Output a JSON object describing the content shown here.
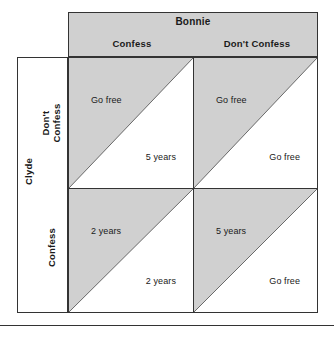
{
  "figure": {
    "column_player": {
      "name": "Bonnie",
      "strategies": [
        "Confess",
        "Don't Confess"
      ]
    },
    "row_player": {
      "name": "Clyde",
      "strategies": [
        "Don't Confess",
        "Confess"
      ]
    },
    "cells": [
      {
        "id": "clyde-dont-confess-bonnie-confess",
        "row": "Don't Confess",
        "column": "Confess",
        "upper_payoff": "Go free",
        "lower_payoff": "5 years"
      },
      {
        "id": "clyde-dont-confess-bonnie-dont-confess",
        "row": "Don't Confess",
        "column": "Don't Confess",
        "upper_payoff": "Go free",
        "lower_payoff": "Go free"
      },
      {
        "id": "clyde-confess-bonnie-confess",
        "row": "Confess",
        "column": "Confess",
        "upper_payoff": "2 years",
        "lower_payoff": "2 years"
      },
      {
        "id": "clyde-confess-bonnie-dont-confess",
        "row": "Confess",
        "column": "Don't Confess",
        "upper_payoff": "5 years",
        "lower_payoff": "Go free"
      }
    ],
    "colors": {
      "shade": "#d0d0d0",
      "line": "#333333",
      "text": "#1a1a1a",
      "background": "#ffffff"
    }
  }
}
